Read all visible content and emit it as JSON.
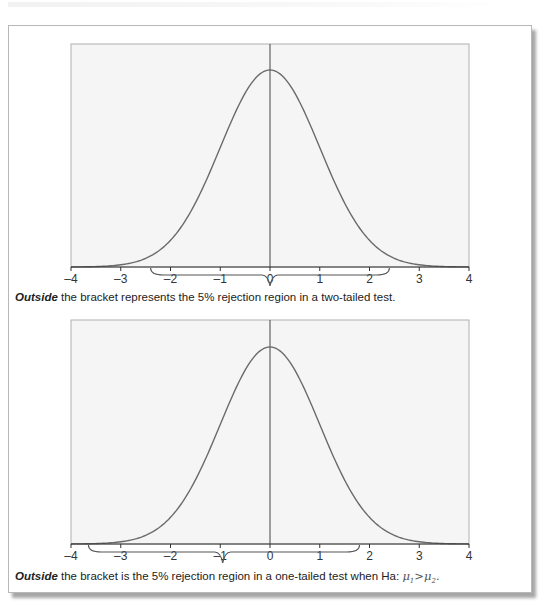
{
  "figures": [
    {
      "caption": {
        "emphasis": "Outside",
        "text": " the bracket represents the 5% rejection region in a two-tailed test."
      }
    },
    {
      "caption": {
        "emphasis": "Outside",
        "text": " the bracket is the 5% rejection region in a one-tailed test when Ha: ",
        "math": {
          "lhs": "μ",
          "lhs_sub": "1",
          "op": ">",
          "rhs": "μ",
          "rhs_sub": "2",
          "end": "."
        }
      }
    }
  ],
  "chart_data": [
    {
      "type": "line",
      "title": "",
      "xlabel": "",
      "ylabel": "",
      "xlim": [
        -4,
        4
      ],
      "x_ticks": [
        -4,
        -3,
        -2,
        -1,
        0,
        1,
        2,
        3,
        4
      ],
      "tick_labels": [
        "–4",
        "–3",
        "–2",
        "–1",
        "0",
        "1",
        "2",
        "3",
        "4"
      ],
      "series": [
        {
          "name": "standard normal curve",
          "function": "N(0,1) pdf"
        }
      ],
      "vertical_line_at": 0,
      "grid": false,
      "bracket": {
        "from": -2.4,
        "to": 2.4,
        "tip": 0
      },
      "annotation": "Outside the bracket represents the 5% rejection region in a two-tailed test."
    },
    {
      "type": "line",
      "title": "",
      "xlabel": "",
      "ylabel": "",
      "xlim": [
        -4,
        4
      ],
      "x_ticks": [
        -4,
        -3,
        -2,
        -1,
        0,
        1,
        2,
        3,
        4
      ],
      "tick_labels": [
        "–4",
        "–3",
        "–2",
        "–1",
        "0",
        "1",
        "2",
        "3",
        "4"
      ],
      "series": [
        {
          "name": "standard normal curve",
          "function": "N(0,1) pdf"
        }
      ],
      "vertical_line_at": 0,
      "grid": false,
      "bracket": {
        "from": -3.65,
        "to": 1.8,
        "tip": -0.95
      },
      "annotation": "Outside the bracket is the 5% rejection region in a one-tailed test when Ha: μ1>μ2."
    }
  ],
  "colors": {
    "curve": "#6a6a6a",
    "axis": "#333333",
    "plot_bg": "#f5f5f5",
    "plot_border": "#b0b0b0",
    "text": "#222222"
  }
}
